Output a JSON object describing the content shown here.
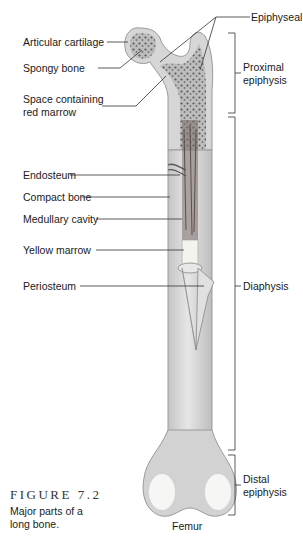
{
  "labels_left": {
    "articular_cartilage": "Articular cartilage",
    "spongy_bone": "Spongy bone",
    "space_red_marrow": "Space containing",
    "space_red_marrow_2": "red marrow",
    "endosteum": "Endosteum",
    "compact_bone": "Compact bone",
    "medullary_cavity": "Medullary cavity",
    "yellow_marrow": "Yellow marrow",
    "periosteum": "Periosteum"
  },
  "labels_right": {
    "epiphyseal_plates": "Epiphyseal plates",
    "proximal_1": "Proximal",
    "proximal_2": "epiphysis",
    "diaphysis": "Diaphysis",
    "distal_1": "Distal",
    "distal_2": "epiphysis"
  },
  "bone_name": "Femur",
  "figure": {
    "number": "FIGURE 7.2",
    "caption": "Major parts of a long bone."
  },
  "colors": {
    "bone": "#d9d9d9",
    "bone_dark": "#b8b8b8",
    "cartilage": "#ececec",
    "spongy": "#6a6a6a",
    "line": "#333333"
  }
}
